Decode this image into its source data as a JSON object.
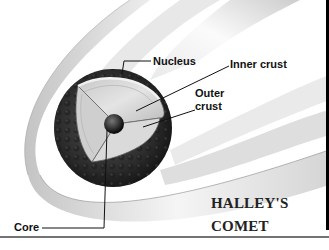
{
  "figure": {
    "title_line1": "HALLEY'S",
    "title_line2": "COMET"
  },
  "labels": {
    "nucleus": "Nucleus",
    "inner_crust": "Inner crust",
    "outer_crust_line1": "Outer",
    "outer_crust_line2": "crust",
    "core": "Core"
  },
  "colors": {
    "background": "#ffffff",
    "tail_shade": "#c8c8c8",
    "nucleus_dark": "#2a2a2a",
    "crust_light": "#d8d8d8",
    "core": "#1a1a1a",
    "leader_lines": "#111111",
    "frame": "#000000"
  }
}
